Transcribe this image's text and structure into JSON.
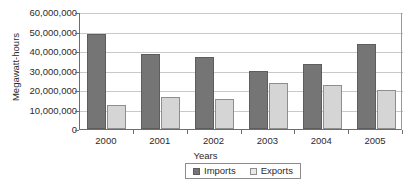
{
  "chart_data": {
    "type": "bar",
    "title": "",
    "xlabel": "Years",
    "ylabel": "Megawatt-hours",
    "categories": [
      "2000",
      "2001",
      "2002",
      "2003",
      "2004",
      "2005"
    ],
    "series": [
      {
        "name": "Imports",
        "color": "#757575",
        "values": [
          48500000,
          38500000,
          36800000,
          29800000,
          33500000,
          43700000
        ]
      },
      {
        "name": "Exports",
        "color": "#d5d5d5",
        "values": [
          12500000,
          16300000,
          15200000,
          23800000,
          22700000,
          20000000
        ]
      }
    ],
    "ylim": [
      0,
      60000000
    ],
    "ytick_values": [
      0,
      10000000,
      20000000,
      30000000,
      40000000,
      50000000,
      60000000
    ],
    "ytick_labels": [
      "0",
      "10,000,000",
      "20,000,000",
      "30,000,000",
      "40,000,000",
      "50,000,000",
      "60,000,000"
    ],
    "grid": "horizontal",
    "legend_position": "bottom",
    "legend_entries": [
      "Imports",
      "Exports"
    ]
  }
}
